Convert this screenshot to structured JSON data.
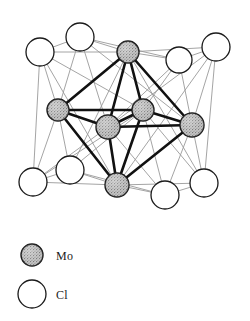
{
  "figure": {
    "kind": "molecular-structure-diagram"
  },
  "legend": {
    "items": [
      {
        "symbol": "Mo",
        "marker": "filled-stippled-circle",
        "fill": "#b8b8b8",
        "stroke": "#1a1a1a"
      },
      {
        "symbol": "Cl",
        "marker": "open-circle",
        "fill": "#ffffff",
        "stroke": "#1a1a1a"
      }
    ],
    "mo_marker": {
      "cx": 32,
      "cy": 255,
      "r": 11
    },
    "cl_marker": {
      "cx": 32,
      "cy": 294,
      "r": 14
    }
  },
  "colors": {
    "mo_fill": "#b9b9b9",
    "mo_stroke": "#1a1a1a",
    "cl_fill": "#ffffff",
    "cl_stroke": "#1a1a1a",
    "mo_bond": "#111111",
    "cl_bond": "#9a9a9a",
    "background": "#ffffff"
  },
  "atoms": {
    "mo": [
      {
        "id": "mo-top",
        "cx": 128,
        "cy": 52,
        "r": 11
      },
      {
        "id": "mo-left",
        "cx": 58,
        "cy": 110,
        "r": 11
      },
      {
        "id": "mo-center-front",
        "cx": 108,
        "cy": 127,
        "r": 12
      },
      {
        "id": "mo-center-back",
        "cx": 143,
        "cy": 110,
        "r": 11
      },
      {
        "id": "mo-right",
        "cx": 192,
        "cy": 125,
        "r": 12
      },
      {
        "id": "mo-bottom",
        "cx": 117,
        "cy": 185,
        "r": 12
      }
    ],
    "cl": [
      {
        "id": "cl-top-left",
        "cx": 40,
        "cy": 52,
        "r": 14
      },
      {
        "id": "cl-top-center",
        "cx": 80,
        "cy": 37,
        "r": 14
      },
      {
        "id": "cl-top-right-in",
        "cx": 179,
        "cy": 60,
        "r": 13
      },
      {
        "id": "cl-top-right-out",
        "cx": 216,
        "cy": 47,
        "r": 14
      },
      {
        "id": "cl-bot-left-out",
        "cx": 33,
        "cy": 182,
        "r": 14
      },
      {
        "id": "cl-bot-left-in",
        "cx": 70,
        "cy": 170,
        "r": 14
      },
      {
        "id": "cl-bot-right-in",
        "cx": 165,
        "cy": 195,
        "r": 14
      },
      {
        "id": "cl-bot-right-out",
        "cx": 204,
        "cy": 183,
        "r": 14
      }
    ]
  },
  "bonds": {
    "mo_mo": [
      [
        "mo-top",
        "mo-left"
      ],
      [
        "mo-top",
        "mo-center-front"
      ],
      [
        "mo-top",
        "mo-center-back"
      ],
      [
        "mo-top",
        "mo-right"
      ],
      [
        "mo-left",
        "mo-center-front"
      ],
      [
        "mo-left",
        "mo-center-back"
      ],
      [
        "mo-left",
        "mo-bottom"
      ],
      [
        "mo-center-front",
        "mo-center-back"
      ],
      [
        "mo-center-front",
        "mo-right"
      ],
      [
        "mo-center-front",
        "mo-bottom"
      ],
      [
        "mo-center-back",
        "mo-right"
      ],
      [
        "mo-center-back",
        "mo-bottom"
      ],
      [
        "mo-right",
        "mo-bottom"
      ]
    ],
    "mo_cl": [
      [
        "cl-top-left",
        "mo-top"
      ],
      [
        "cl-top-left",
        "mo-left"
      ],
      [
        "cl-top-left",
        "mo-center-back"
      ],
      [
        "cl-top-left",
        "mo-bottom"
      ],
      [
        "cl-top-center",
        "mo-top"
      ],
      [
        "cl-top-center",
        "mo-left"
      ],
      [
        "cl-top-center",
        "mo-center-front"
      ],
      [
        "cl-top-center",
        "mo-right"
      ],
      [
        "cl-top-right-in",
        "mo-top"
      ],
      [
        "cl-top-right-in",
        "mo-center-back"
      ],
      [
        "cl-top-right-in",
        "mo-right"
      ],
      [
        "cl-top-right-in",
        "mo-center-front"
      ],
      [
        "cl-top-right-out",
        "mo-top"
      ],
      [
        "cl-top-right-out",
        "mo-right"
      ],
      [
        "cl-top-right-out",
        "mo-center-front"
      ],
      [
        "cl-top-right-out",
        "mo-bottom"
      ],
      [
        "cl-bot-left-out",
        "mo-left"
      ],
      [
        "cl-bot-left-out",
        "mo-bottom"
      ],
      [
        "cl-bot-left-out",
        "mo-center-front"
      ],
      [
        "cl-bot-left-out",
        "mo-center-back"
      ],
      [
        "cl-bot-left-in",
        "mo-left"
      ],
      [
        "cl-bot-left-in",
        "mo-bottom"
      ],
      [
        "cl-bot-left-in",
        "mo-center-back"
      ],
      [
        "cl-bot-left-in",
        "mo-top"
      ],
      [
        "cl-bot-right-in",
        "mo-bottom"
      ],
      [
        "cl-bot-right-in",
        "mo-right"
      ],
      [
        "cl-bot-right-in",
        "mo-center-front"
      ],
      [
        "cl-bot-right-in",
        "mo-center-back"
      ],
      [
        "cl-bot-right-out",
        "mo-right"
      ],
      [
        "cl-bot-right-out",
        "mo-bottom"
      ],
      [
        "cl-bot-right-out",
        "mo-center-back"
      ],
      [
        "cl-bot-right-out",
        "mo-top"
      ]
    ],
    "cl_cl": [
      [
        "cl-top-left",
        "cl-top-center"
      ],
      [
        "cl-top-left",
        "cl-bot-left-out"
      ],
      [
        "cl-top-center",
        "cl-top-right-in"
      ],
      [
        "cl-top-right-in",
        "cl-top-right-out"
      ],
      [
        "cl-top-right-out",
        "cl-bot-right-out"
      ],
      [
        "cl-bot-left-out",
        "cl-bot-left-in"
      ],
      [
        "cl-bot-left-in",
        "cl-bot-right-in"
      ],
      [
        "cl-bot-right-in",
        "cl-bot-right-out"
      ]
    ]
  }
}
